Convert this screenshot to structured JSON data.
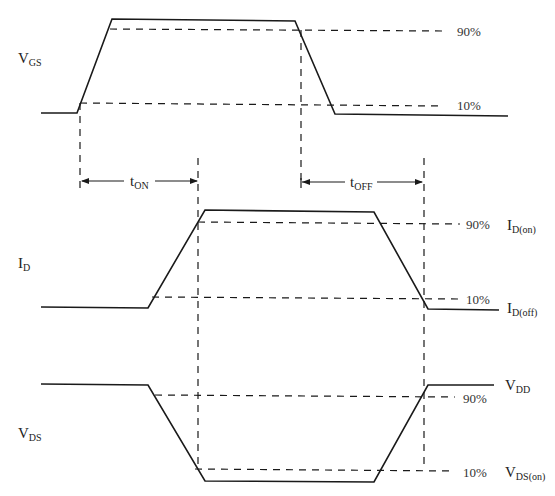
{
  "diagram": {
    "type": "MOSFET switching waveforms",
    "signals": [
      {
        "name": "V",
        "sub": "GS"
      },
      {
        "name": "I",
        "sub": "D"
      },
      {
        "name": "V",
        "sub": "DS"
      }
    ],
    "levels": {
      "p90": "90%",
      "p10": "10%"
    },
    "right_labels": {
      "id_on": {
        "name": "I",
        "sub": "D(on)"
      },
      "id_off": {
        "name": "I",
        "sub": "D(off)"
      },
      "vdd": {
        "name": "V",
        "sub": "DD"
      },
      "vds_on": {
        "name": "V",
        "sub": "DS(on)"
      }
    },
    "intervals": {
      "t_on": {
        "name": "t",
        "sub": "ON"
      },
      "t_off": {
        "name": "t",
        "sub": "OFF"
      }
    }
  }
}
